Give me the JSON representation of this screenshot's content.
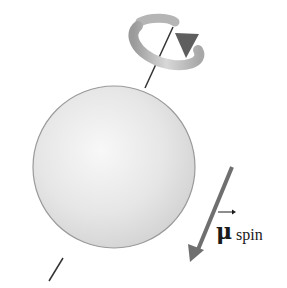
{
  "figure": {
    "labels": {
      "vector_symbol": "μ",
      "vector_subscript": "spin"
    },
    "colors": {
      "sphere_fill": "#e4e4e4",
      "sphere_edge": "#9a9a9a",
      "axis_line": "#333333",
      "arrow": "#6f6f6f",
      "rotation_arrow": "#8a8a8a"
    }
  }
}
